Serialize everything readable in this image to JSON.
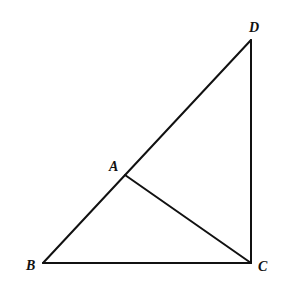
{
  "diagram": {
    "type": "geometry",
    "points": {
      "A": {
        "label": "A",
        "x": 125,
        "y": 175,
        "label_x": 109,
        "label_y": 171
      },
      "B": {
        "label": "B",
        "x": 43,
        "y": 263,
        "label_x": 26,
        "label_y": 270
      },
      "C": {
        "label": "C",
        "x": 251,
        "y": 263,
        "label_x": 258,
        "label_y": 271
      },
      "D": {
        "label": "D",
        "x": 251,
        "y": 40,
        "label_x": 249,
        "label_y": 32
      }
    },
    "segments": [
      {
        "name": "BD",
        "from": "B",
        "to": "D"
      },
      {
        "name": "BC",
        "from": "B",
        "to": "C"
      },
      {
        "name": "CD",
        "from": "C",
        "to": "D"
      },
      {
        "name": "AC",
        "from": "A",
        "to": "C"
      }
    ],
    "colors": {
      "line": "#111111",
      "background": "#ffffff"
    }
  }
}
